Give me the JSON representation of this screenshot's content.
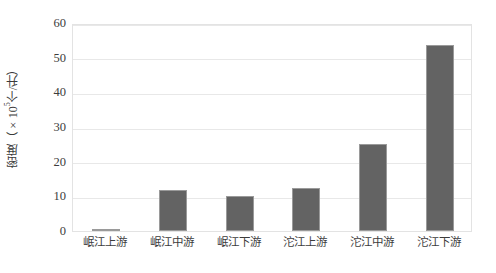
{
  "chart_data": {
    "type": "bar",
    "title": "",
    "xlabel": "",
    "ylabel": "密度（×10⁵个/升）",
    "ylabel_prefix": "密度（×10",
    "ylabel_exponent": "5",
    "ylabel_suffix": "个/升）",
    "categories": [
      "岷江上游",
      "岷江中游",
      "岷江下游",
      "沱江上游",
      "沱江中游",
      "沱江下游"
    ],
    "values": [
      0.6,
      11.8,
      10.0,
      12.3,
      25.1,
      53.8
    ],
    "ylim": [
      0,
      60
    ],
    "yticks": [
      0,
      10,
      20,
      30,
      40,
      50,
      60
    ],
    "ytick_labels": [
      "0",
      "10",
      "20",
      "30",
      "40",
      "50",
      "60"
    ],
    "grid": true,
    "grid_axis": "y",
    "legend": false,
    "legend_position": "none",
    "bar_color": "#636363",
    "bar_border_color": "#9a9a9a",
    "grid_color": "#e8e8e8",
    "frame_color": "#e3e3e3",
    "text_color": "#3c3c3c",
    "background": "#ffffff"
  }
}
